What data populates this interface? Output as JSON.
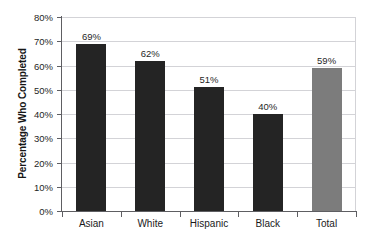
{
  "chart_data": {
    "type": "bar",
    "title": "",
    "xlabel": "",
    "ylabel": "Percentage Who Completed",
    "categories": [
      "Asian",
      "White",
      "Hispanic",
      "Black",
      "Total"
    ],
    "values": [
      69,
      62,
      51,
      40,
      59
    ],
    "value_labels": [
      "69%",
      "62%",
      "51%",
      "40%",
      "59%"
    ],
    "ylim": [
      0,
      80
    ],
    "ytick_labels": [
      "0%",
      "10%",
      "20%",
      "30%",
      "40%",
      "50%",
      "60%",
      "70%",
      "80%"
    ],
    "ytick_values": [
      0,
      10,
      20,
      30,
      40,
      50,
      60,
      70,
      80
    ],
    "grid": true,
    "legend": false,
    "bar_colors": [
      "#242424",
      "#242424",
      "#242424",
      "#242424",
      "#7c7c7c"
    ],
    "colors": {
      "bar_dark": "#242424",
      "bar_total": "#7c7c7c",
      "gridline": "#d3d3d7",
      "axis": "#5e5e62",
      "background": "#ffffff",
      "text": "#1a1a1a"
    }
  }
}
